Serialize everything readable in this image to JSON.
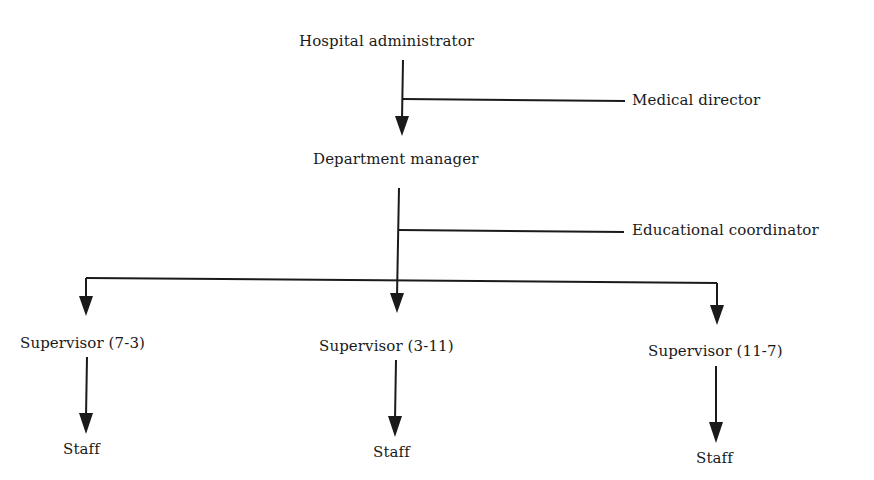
{
  "chart": {
    "type": "org-chart",
    "line_color": "#1a1a1a",
    "nodes": {
      "hospital_administrator": "Hospital administrator",
      "medical_director": "Medical director",
      "department_manager": "Department manager",
      "educational_coordinator": "Educational coordinator",
      "supervisor_7_3": "Supervisor (7-3)",
      "supervisor_3_11": "Supervisor (3-11)",
      "supervisor_11_7": "Supervisor (11-7)",
      "staff_1": "Staff",
      "staff_2": "Staff",
      "staff_3": "Staff"
    },
    "edges": [
      {
        "from": "Hospital administrator",
        "to": "Department manager",
        "type": "arrow"
      },
      {
        "from": "Hospital administrator",
        "to": "Medical director",
        "type": "staff-line"
      },
      {
        "from": "Department manager",
        "to": "Educational coordinator",
        "type": "staff-line"
      },
      {
        "from": "Department manager",
        "to": "Supervisor (7-3)",
        "type": "arrow"
      },
      {
        "from": "Department manager",
        "to": "Supervisor (3-11)",
        "type": "arrow"
      },
      {
        "from": "Department manager",
        "to": "Supervisor (11-7)",
        "type": "arrow"
      },
      {
        "from": "Supervisor (7-3)",
        "to": "Staff",
        "type": "arrow"
      },
      {
        "from": "Supervisor (3-11)",
        "to": "Staff",
        "type": "arrow"
      },
      {
        "from": "Supervisor (11-7)",
        "to": "Staff",
        "type": "arrow"
      }
    ]
  }
}
